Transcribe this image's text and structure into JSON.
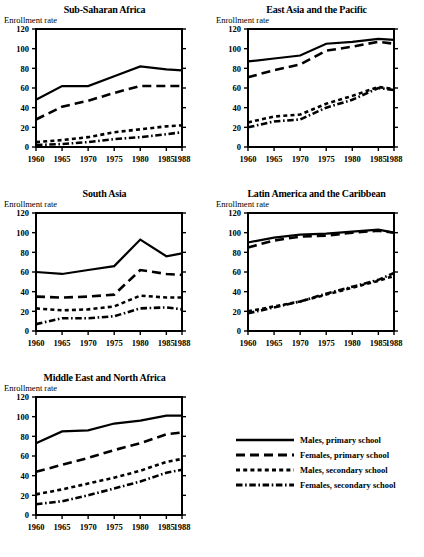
{
  "axis": {
    "ylabel": "Enrollment rate",
    "yticks": [
      0,
      20,
      40,
      60,
      80,
      100,
      120
    ],
    "xticks": [
      "1960",
      "1965",
      "1970",
      "1975",
      "1980",
      "1985",
      "1988"
    ]
  },
  "legend": {
    "items": [
      {
        "label": "Males, primary school",
        "style": "solid"
      },
      {
        "label": "Females, primary school",
        "style": "dashed"
      },
      {
        "label": "Males, secondary school",
        "style": "dotted"
      },
      {
        "label": "Females, secondary school",
        "style": "dashdot"
      }
    ]
  },
  "chart_data": [
    {
      "type": "line",
      "title": "Sub-Saharan Africa",
      "xlabel": "",
      "ylabel": "Enrollment rate",
      "x": [
        1960,
        1965,
        1970,
        1975,
        1980,
        1985,
        1988
      ],
      "xlim": [
        1960,
        1988
      ],
      "ylim": [
        0,
        120
      ],
      "grid": false,
      "series": [
        {
          "name": "Males, primary school",
          "style": "solid",
          "values": [
            48,
            62,
            62,
            72,
            82,
            79,
            78
          ]
        },
        {
          "name": "Females, primary school",
          "style": "dashed",
          "values": [
            28,
            41,
            47,
            55,
            62,
            62,
            62
          ]
        },
        {
          "name": "Males, secondary school",
          "style": "dotted",
          "values": [
            5,
            7,
            10,
            15,
            18,
            21,
            22
          ]
        },
        {
          "name": "Females, secondary school",
          "style": "dashdot",
          "values": [
            2,
            3,
            5,
            8,
            10,
            13,
            15
          ]
        }
      ]
    },
    {
      "type": "line",
      "title": "East Asia and the Pacific",
      "xlabel": "",
      "ylabel": "Enrollment rate",
      "x": [
        1960,
        1965,
        1970,
        1975,
        1980,
        1985,
        1988
      ],
      "xlim": [
        1960,
        1988
      ],
      "ylim": [
        0,
        120
      ],
      "grid": false,
      "series": [
        {
          "name": "Males, primary school",
          "style": "solid",
          "values": [
            87,
            90,
            93,
            105,
            107,
            110,
            109
          ]
        },
        {
          "name": "Females, primary school",
          "style": "dashed",
          "values": [
            71,
            78,
            84,
            98,
            102,
            107,
            105
          ]
        },
        {
          "name": "Males, secondary school",
          "style": "dotted",
          "values": [
            25,
            31,
            33,
            44,
            52,
            61,
            59
          ]
        },
        {
          "name": "Females, secondary school",
          "style": "dashdot",
          "values": [
            20,
            26,
            28,
            40,
            48,
            60,
            58
          ]
        }
      ]
    },
    {
      "type": "line",
      "title": "South Asia",
      "xlabel": "",
      "ylabel": "Enrollment rate",
      "x": [
        1960,
        1965,
        1970,
        1975,
        1980,
        1985,
        1988
      ],
      "xlim": [
        1960,
        1988
      ],
      "ylim": [
        0,
        120
      ],
      "grid": false,
      "series": [
        {
          "name": "Males, primary school",
          "style": "solid",
          "values": [
            60,
            58,
            62,
            66,
            93,
            76,
            79
          ]
        },
        {
          "name": "Females, primary school",
          "style": "dashed",
          "values": [
            35,
            34,
            35,
            37,
            62,
            58,
            57
          ]
        },
        {
          "name": "Males, secondary school",
          "style": "dotted",
          "values": [
            23,
            21,
            22,
            25,
            36,
            34,
            34
          ]
        },
        {
          "name": "Females, secondary school",
          "style": "dashdot",
          "values": [
            7,
            13,
            13,
            15,
            23,
            24,
            22
          ]
        }
      ]
    },
    {
      "type": "line",
      "title": "Latin America and the Caribbean",
      "xlabel": "",
      "ylabel": "Enrollment rate",
      "x": [
        1960,
        1965,
        1970,
        1975,
        1980,
        1985,
        1988
      ],
      "xlim": [
        1960,
        1988
      ],
      "ylim": [
        0,
        120
      ],
      "grid": false,
      "series": [
        {
          "name": "Males, primary school",
          "style": "solid",
          "values": [
            90,
            95,
            98,
            99,
            101,
            103,
            100
          ]
        },
        {
          "name": "Females, primary school",
          "style": "dashed",
          "values": [
            85,
            92,
            96,
            97,
            100,
            102,
            100
          ]
        },
        {
          "name": "Males, secondary school",
          "style": "dotted",
          "values": [
            20,
            25,
            30,
            37,
            44,
            51,
            56
          ]
        },
        {
          "name": "Females, secondary school",
          "style": "dashdot",
          "values": [
            18,
            24,
            30,
            38,
            45,
            52,
            59
          ]
        }
      ]
    },
    {
      "type": "line",
      "title": "Middle East and North Africa",
      "xlabel": "",
      "ylabel": "Enrollment rate",
      "x": [
        1960,
        1965,
        1970,
        1975,
        1980,
        1985,
        1988
      ],
      "xlim": [
        1960,
        1988
      ],
      "ylim": [
        0,
        120
      ],
      "grid": false,
      "series": [
        {
          "name": "Males, primary school",
          "style": "solid",
          "values": [
            73,
            85,
            86,
            93,
            96,
            101,
            101
          ]
        },
        {
          "name": "Females, primary school",
          "style": "dashed",
          "values": [
            44,
            51,
            58,
            66,
            73,
            82,
            84
          ]
        },
        {
          "name": "Males, secondary school",
          "style": "dotted",
          "values": [
            21,
            26,
            32,
            38,
            45,
            54,
            57
          ]
        },
        {
          "name": "Females, secondary school",
          "style": "dashdot",
          "values": [
            11,
            14,
            20,
            27,
            34,
            43,
            46
          ]
        }
      ]
    }
  ]
}
